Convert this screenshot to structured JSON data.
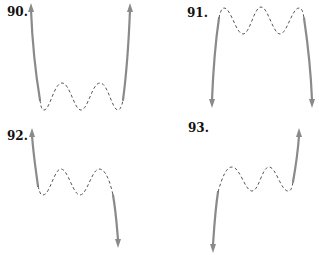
{
  "problems": [
    {
      "number": "90.",
      "left_end": "up",
      "right_end": "up",
      "turning_points": 5
    },
    {
      "number": "91.",
      "left_end": "down",
      "right_end": "down",
      "turning_points": 5
    },
    {
      "number": "92.",
      "left_end": "up",
      "right_end": "down",
      "turning_points": 4
    },
    {
      "number": "93.",
      "left_end": "down",
      "right_end": "up",
      "turning_points": 4
    }
  ],
  "colors": {
    "solid_curve": "#8a8a8a",
    "dashed_curve": "#555555",
    "label": "#111111"
  }
}
